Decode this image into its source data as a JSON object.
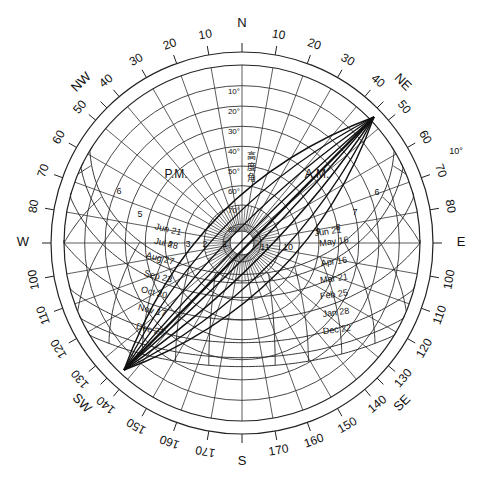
{
  "diagram": {
    "type": "sun-path-diagram",
    "center": [
      242,
      243
    ],
    "horizon_radius": 178,
    "outer_radius": 191,
    "compass_labels": [
      {
        "text": "N",
        "az": 0
      },
      {
        "text": "NE",
        "az": 45
      },
      {
        "text": "E",
        "az": 90
      },
      {
        "text": "SE",
        "az": 135
      },
      {
        "text": "S",
        "az": 180
      },
      {
        "text": "SW",
        "az": 225
      },
      {
        "text": "W",
        "az": 270
      },
      {
        "text": "NW",
        "az": 315
      }
    ],
    "azimuth_tick_labels": [
      {
        "text": "10",
        "az": 10
      },
      {
        "text": "20",
        "az": 20
      },
      {
        "text": "30",
        "az": 30
      },
      {
        "text": "40",
        "az": 40
      },
      {
        "text": "50",
        "az": 50
      },
      {
        "text": "60",
        "az": 60
      },
      {
        "text": "70",
        "az": 70
      },
      {
        "text": "80",
        "az": 80
      },
      {
        "text": "100",
        "az": 100
      },
      {
        "text": "110",
        "az": 110
      },
      {
        "text": "120",
        "az": 120
      },
      {
        "text": "130",
        "az": 130
      },
      {
        "text": "140",
        "az": 140
      },
      {
        "text": "150",
        "az": 150
      },
      {
        "text": "160",
        "az": 160
      },
      {
        "text": "170",
        "az": 170
      },
      {
        "text": "170",
        "az": 190
      },
      {
        "text": "160",
        "az": 200
      },
      {
        "text": "150",
        "az": 210
      },
      {
        "text": "140",
        "az": 220
      },
      {
        "text": "130",
        "az": 230
      },
      {
        "text": "120",
        "az": 240
      },
      {
        "text": "110",
        "az": 250
      },
      {
        "text": "100",
        "az": 260
      },
      {
        "text": "80",
        "az": 280
      },
      {
        "text": "70",
        "az": 290
      },
      {
        "text": "60",
        "az": 300
      },
      {
        "text": "50",
        "az": 310
      },
      {
        "text": "40",
        "az": 320
      },
      {
        "text": "30",
        "az": 330
      },
      {
        "text": "20",
        "az": 340
      },
      {
        "text": "10",
        "az": 350
      }
    ],
    "altitude_labels": [
      "10°",
      "20°",
      "30°",
      "40°",
      "50°",
      "60°",
      "70°",
      "80°"
    ],
    "altitude_axis_title": "高度角",
    "side_label": "10°",
    "period_labels": {
      "pm": "P.M.",
      "am": "A.M."
    },
    "hour_labels_pm": [
      "6",
      "5",
      "4",
      "3",
      "2",
      "1"
    ],
    "hour_labels_am": [
      "6",
      "7",
      "8",
      "9",
      "10",
      "11"
    ],
    "date_labels_pm": [
      "Jun 21",
      "Jul 28",
      "Aug 27",
      "Sep 23",
      "Oct 20",
      "Nov 17",
      "Dec 22"
    ],
    "date_labels_am": [
      "Jun 21",
      "May 16",
      "Apr 16",
      "Mar 21",
      "Feb 25",
      "Jan 28",
      "Dec 22"
    ],
    "overlay_fan_points": {
      "ne": [
        374,
        117
      ],
      "sw": [
        124,
        370
      ]
    }
  }
}
